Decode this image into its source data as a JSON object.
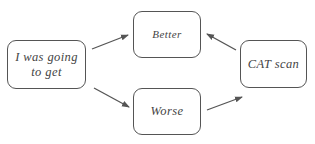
{
  "diagram": {
    "nodes": [
      {
        "id": "start",
        "label": "I was going to get"
      },
      {
        "id": "better",
        "label": "Better"
      },
      {
        "id": "worse",
        "label": "Worse"
      },
      {
        "id": "cat",
        "label": "CAT scan"
      }
    ],
    "edges": [
      {
        "from": "start",
        "to": "better"
      },
      {
        "from": "start",
        "to": "worse"
      },
      {
        "from": "worse",
        "to": "cat"
      },
      {
        "from": "cat",
        "to": "better"
      }
    ],
    "colors": {
      "stroke": "#555555",
      "text": "#444444",
      "arrow": "#555555"
    }
  }
}
